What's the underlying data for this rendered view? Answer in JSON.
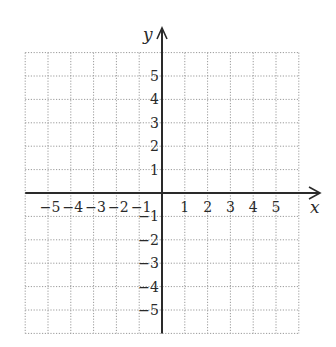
{
  "chart_data": {
    "type": "coordinate-grid",
    "title": "",
    "xlabel": "x",
    "ylabel": "y",
    "xlim": [
      -6,
      6
    ],
    "ylim": [
      -6,
      6
    ],
    "grid": true,
    "grid_style": "dotted",
    "x_tick_labels": [
      "−5",
      "−4",
      "−3",
      "−2",
      "−1",
      "1",
      "2",
      "3",
      "4",
      "5"
    ],
    "x_tick_values": [
      -5,
      -4,
      -3,
      -2,
      -1,
      1,
      2,
      3,
      4,
      5
    ],
    "y_tick_labels": [
      "5",
      "4",
      "3",
      "2",
      "1",
      "−1",
      "−2",
      "−3",
      "−4",
      "−5"
    ],
    "y_tick_values": [
      5,
      4,
      3,
      2,
      1,
      -1,
      -2,
      -3,
      -4,
      -5
    ],
    "series": []
  },
  "colors": {
    "grid": "#9a9a9a",
    "axis": "#2a2a2a",
    "background": "#ffffff"
  },
  "geometry": {
    "origin_x": 162,
    "origin_y": 193,
    "unit_x": 22.8,
    "unit_y": 23.4
  }
}
